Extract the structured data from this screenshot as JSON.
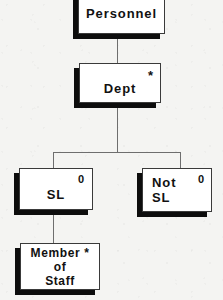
{
  "diagram": {
    "notation": "Jackson structure diagram",
    "colors": {
      "background": "#f4f4f2",
      "box_fill": "#ffffff",
      "box_border": "#3a3a3a",
      "shadow": "#0d0d0d",
      "connector": "#6e6e6e",
      "text": "#111111"
    },
    "nodes": [
      {
        "id": "personnel",
        "label": "Personnel",
        "marker": "",
        "marker_type": "none",
        "level": 0
      },
      {
        "id": "dept",
        "label": "Dept",
        "marker": "*",
        "marker_type": "iteration",
        "level": 1
      },
      {
        "id": "sl",
        "label": "SL",
        "marker": "0",
        "marker_type": "selection",
        "level": 2
      },
      {
        "id": "notsl",
        "label": "Not\nSL",
        "marker": "0",
        "marker_type": "selection",
        "level": 2
      },
      {
        "id": "member",
        "label": "Member *\nof\nStaff",
        "marker": "",
        "marker_type": "none",
        "level": 3
      }
    ],
    "edges": [
      {
        "from": "personnel",
        "to": "dept"
      },
      {
        "from": "dept",
        "to": "sl"
      },
      {
        "from": "dept",
        "to": "notsl"
      },
      {
        "from": "sl",
        "to": "member"
      }
    ]
  }
}
